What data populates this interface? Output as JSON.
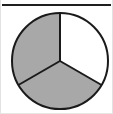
{
  "figure": {
    "name": "three-slice-pie-diagram",
    "width": 113,
    "height": 114,
    "background_color": "#ffffff"
  },
  "rules": {
    "top_rule_color": "#1f1f1f",
    "frame_color": "#e2e2e2"
  },
  "chart_data": {
    "type": "pie",
    "title": "",
    "subtitle": "",
    "xlabel": "",
    "ylabel": "",
    "grid": false,
    "legend": "none",
    "center": {
      "cx": 60,
      "cy": 61
    },
    "radius": 48,
    "start_angle_deg": 90,
    "direction": "clockwise",
    "outline_color": "#1a1a1a",
    "outline_width": 2,
    "divider_color": "#1a1a1a",
    "divider_width": 2,
    "categories": [
      "Slice 1",
      "Slice 2",
      "Slice 3"
    ],
    "values": [
      33.3,
      33.3,
      33.3
    ],
    "slices": [
      {
        "label": "Slice 1",
        "position": "upper-right",
        "value": 33.3,
        "angle_deg": 120,
        "start_deg": 90,
        "end_deg": 330,
        "fill": "#ffffff"
      },
      {
        "label": "Slice 2",
        "position": "bottom",
        "value": 33.3,
        "angle_deg": 120,
        "start_deg": 330,
        "end_deg": 210,
        "fill": "#a8a8a8"
      },
      {
        "label": "Slice 3",
        "position": "upper-left",
        "value": 33.3,
        "angle_deg": 120,
        "start_deg": 210,
        "end_deg": 90,
        "fill": "#a8a8a8"
      }
    ],
    "annotations": []
  }
}
